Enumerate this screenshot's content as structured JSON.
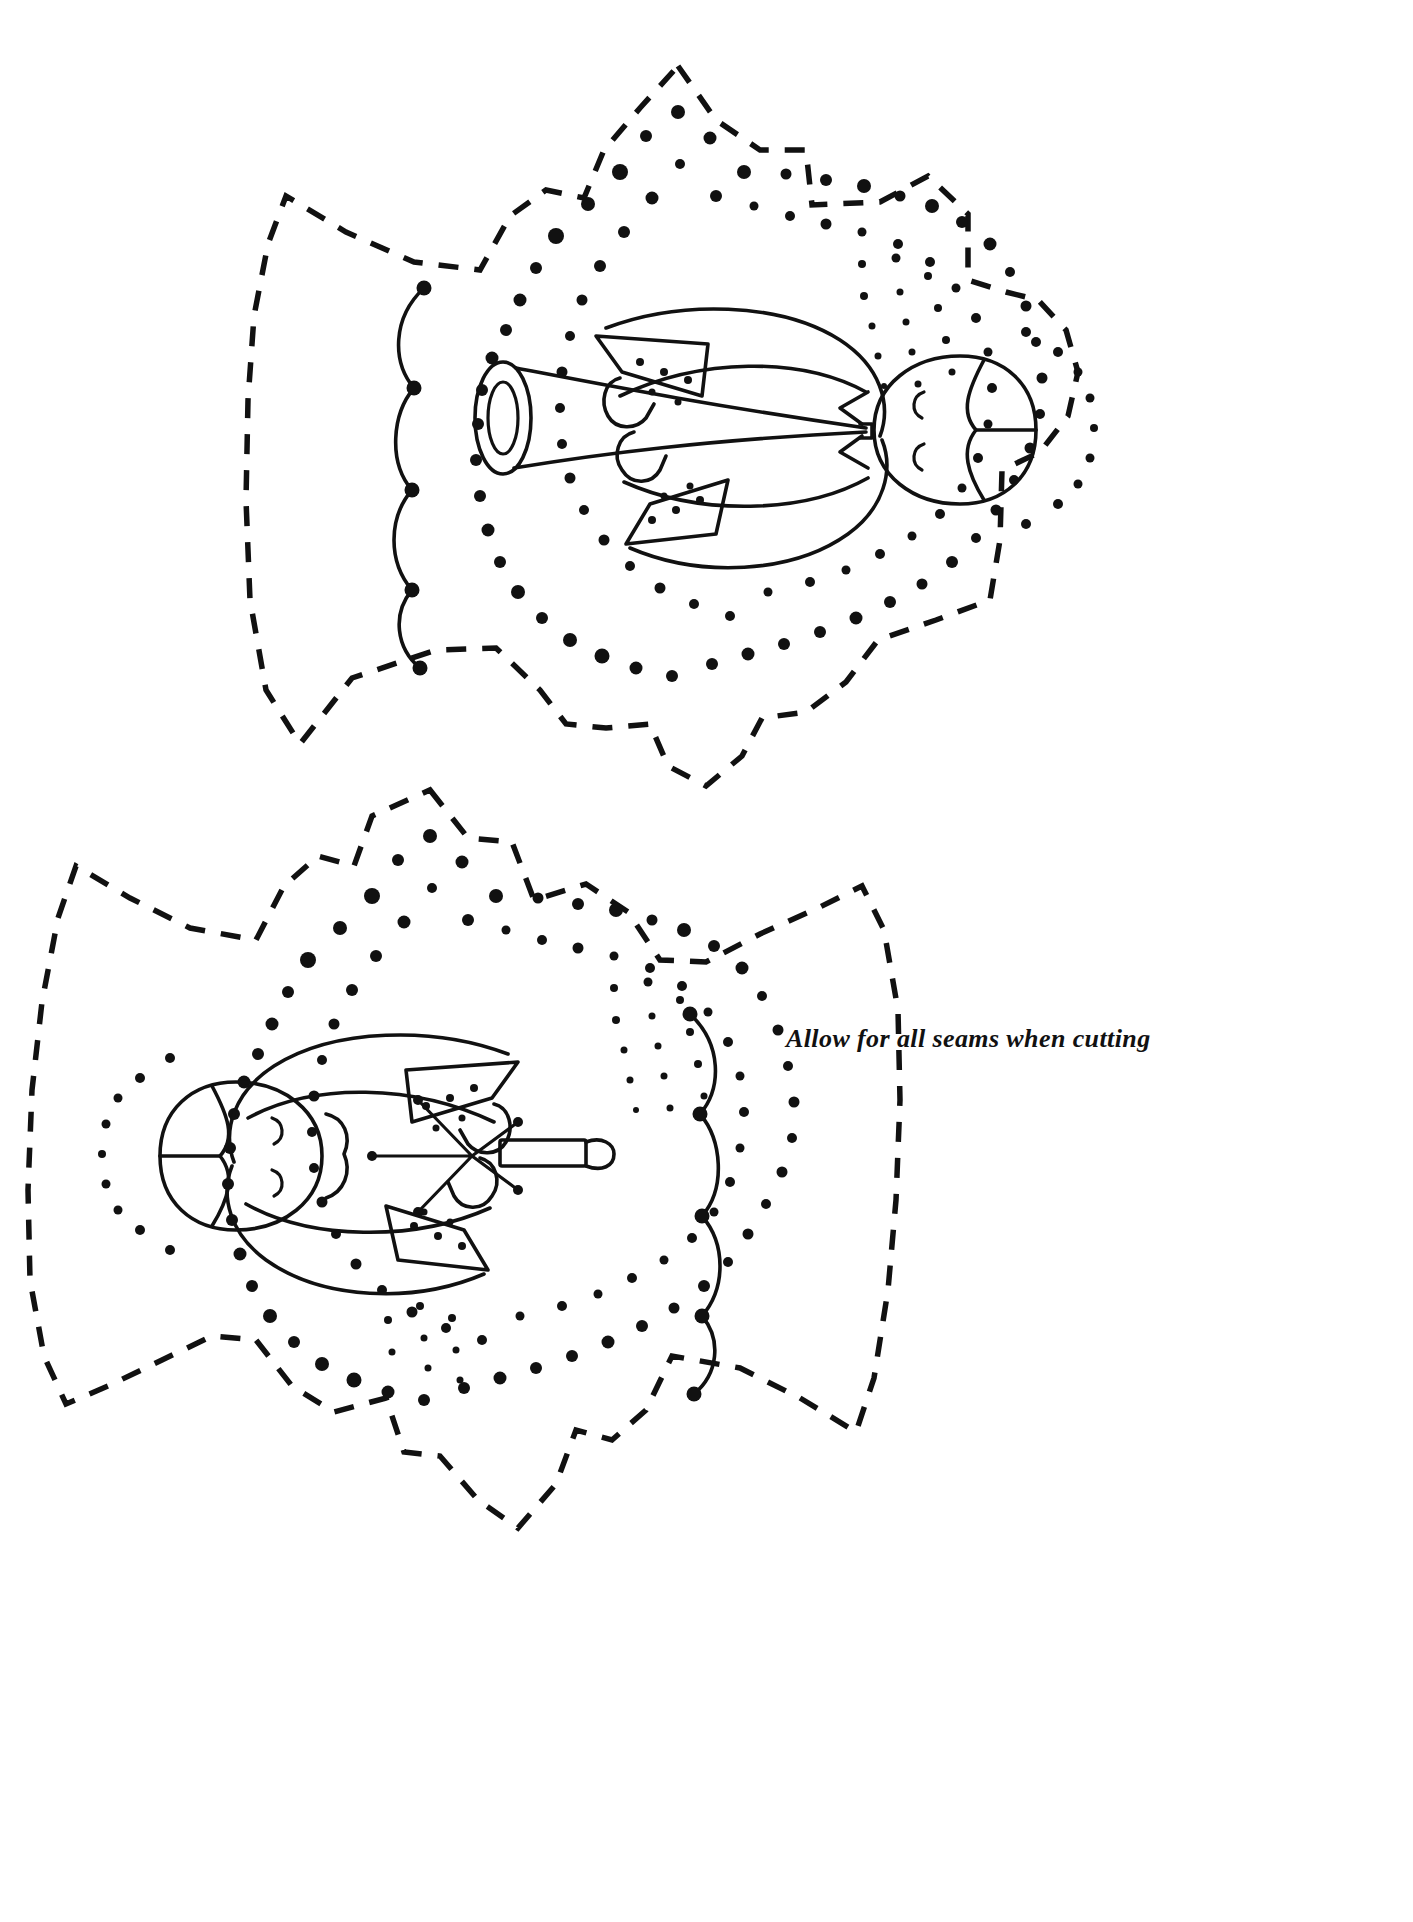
{
  "page": {
    "background_color": "#ffffff",
    "ink_color": "#111111",
    "width": 1413,
    "height": 1922
  },
  "caption": {
    "text": "Allow for all seams when cutting",
    "x": 786,
    "y": 1024,
    "style": "italic-serif-bold"
  },
  "legend": {
    "dashed_line_meaning": "cutting line",
    "dotted_line_meaning": "embroidery / stitch dots",
    "solid_line_meaning": "appliqué outline"
  },
  "figures": [
    {
      "id": "angel-top",
      "name": "Angel with trumpet",
      "orientation": "rotated 90 degrees, head at right",
      "center": {
        "x": 660,
        "y": 440
      },
      "parts": [
        "dashed-cut-outline",
        "dotted-stitch-border",
        "scalloped-wing-edge",
        "head",
        "hair",
        "closed-eye-upper",
        "closed-eye-lower",
        "robe-body",
        "sleeve-upper",
        "sleeve-lower",
        "arm-upper",
        "arm-lower",
        "trumpet"
      ],
      "held_object": "trumpet"
    },
    {
      "id": "angel-bottom",
      "name": "Angel with star",
      "orientation": "rotated 90 degrees, head at left",
      "center": {
        "x": 620,
        "y": 1310
      },
      "parts": [
        "dashed-cut-outline",
        "dotted-stitch-border",
        "scalloped-wing-edge",
        "head",
        "hair",
        "closed-eye-upper",
        "closed-eye-lower",
        "robe-body",
        "sleeve-upper",
        "sleeve-lower",
        "arm-upper",
        "arm-lower",
        "star-sparkle",
        "candle-bar"
      ],
      "held_object": "star and candle"
    }
  ]
}
